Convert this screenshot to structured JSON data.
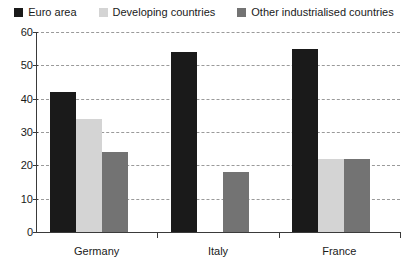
{
  "chart_data": {
    "type": "bar",
    "title": "",
    "xlabel": "",
    "ylabel": "",
    "ylim": [
      0,
      60
    ],
    "yticks": [
      0,
      10,
      20,
      30,
      40,
      50,
      60
    ],
    "grid": true,
    "legend_position": "top",
    "categories": [
      "Germany",
      "Italy",
      "France"
    ],
    "series": [
      {
        "name": "Euro area",
        "color": "#1a1a1a",
        "values": [
          42,
          54,
          55
        ]
      },
      {
        "name": "Developing countries",
        "color": "#d4d4d4",
        "values": [
          34,
          0,
          22
        ]
      },
      {
        "name": "Other industrialised countries",
        "color": "#737373",
        "values": [
          24,
          18,
          22
        ]
      }
    ]
  },
  "axis": {
    "y_tick_labels": [
      "0",
      "10",
      "20",
      "30",
      "40",
      "50",
      "60"
    ],
    "x_tick_labels": [
      "Germany",
      "Italy",
      "France"
    ]
  },
  "legend": {
    "items": [
      {
        "label": "Euro area",
        "color": "#1a1a1a"
      },
      {
        "label": "Developing countries",
        "color": "#d4d4d4"
      },
      {
        "label": "Other industrialised countries",
        "color": "#737373"
      }
    ]
  },
  "style": {
    "axis_color": "#3a3a3a",
    "grid_color": "#9a9a9a",
    "background": "#ffffff",
    "text_color": "#1a1a1a"
  }
}
